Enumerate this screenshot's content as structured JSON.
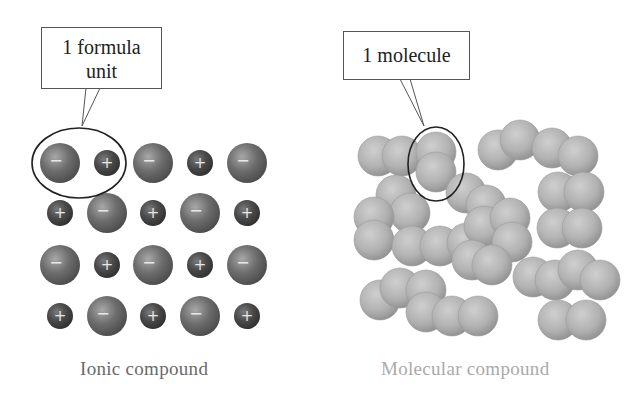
{
  "ionic": {
    "callout_line1": "1 formula",
    "callout_line2": "unit",
    "caption": "Ionic compound",
    "caption_color": "#6a6a6a",
    "anion_color": "#6b6b6b",
    "cation_color": "#4a4a4a",
    "anion_symbol": "−",
    "cation_symbol": "+",
    "grid_rows": 4,
    "grid_cols": 5
  },
  "molecular": {
    "callout": "1 molecule",
    "caption": "Molecular compound",
    "caption_color": "#aaaaaa",
    "molecule_color": "#b0b0b0",
    "molecule_count": 16
  }
}
